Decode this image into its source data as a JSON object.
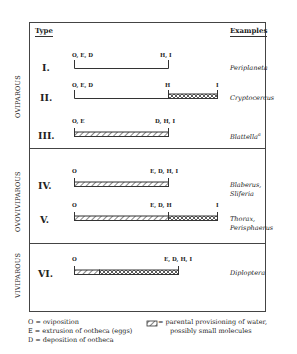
{
  "header": {
    "type_label": "Type",
    "examples_label": "Examples"
  },
  "groups": [
    {
      "name": "OVIPAROUS"
    },
    {
      "name": "OVOVIVIPAROUS"
    },
    {
      "name": "VIVIPAROUS"
    }
  ],
  "rows": [
    {
      "type": "I.",
      "left_label": "O, E, D",
      "mid_label": "H, I",
      "end_label": "",
      "example": "Periplaneta",
      "example2": "",
      "segments": "line-only"
    },
    {
      "type": "II.",
      "left_label": "O, E, D",
      "mid_label": "H",
      "end_label": "I",
      "example": "Cryptocercus",
      "example2": "",
      "segments": "line then crosshatch"
    },
    {
      "type": "III.",
      "left_label": "O, E",
      "mid_label": "D, H, I",
      "end_label": "",
      "example": "Blattella",
      "example_sup": "a",
      "example2": "",
      "segments": "hatched"
    },
    {
      "type": "IV.",
      "left_label": "O",
      "mid_label": "E, D, H, I",
      "end_label": "",
      "example": "Blaberus,",
      "example2": "Sliferia",
      "segments": "hatched"
    },
    {
      "type": "V.",
      "left_label": "O",
      "mid_label": "E, D, H",
      "end_label": "I",
      "example": "Thorax,",
      "example2": "Perisphaerus",
      "segments": "hatched then crosshatch"
    },
    {
      "type": "VI.",
      "left_label": "O",
      "mid_label": "E, D, H, I",
      "end_label": "",
      "example": "Diploptera",
      "example2": "",
      "segments": "hatched then crosshatch"
    }
  ],
  "legend": {
    "left": [
      {
        "key": "O =",
        "text": "oviposition"
      },
      {
        "key": "E =",
        "text": "extrusion of ootheca (eggs)"
      },
      {
        "key": "D =",
        "text": "deposition of ootheca"
      }
    ],
    "right": [
      {
        "key": "hatched-box",
        "text": "= parental provisioning of water,",
        "text2": "possibly small molecules"
      }
    ]
  },
  "colors": {
    "ink": "#333333",
    "border": "#444444",
    "background": "#ffffff"
  }
}
